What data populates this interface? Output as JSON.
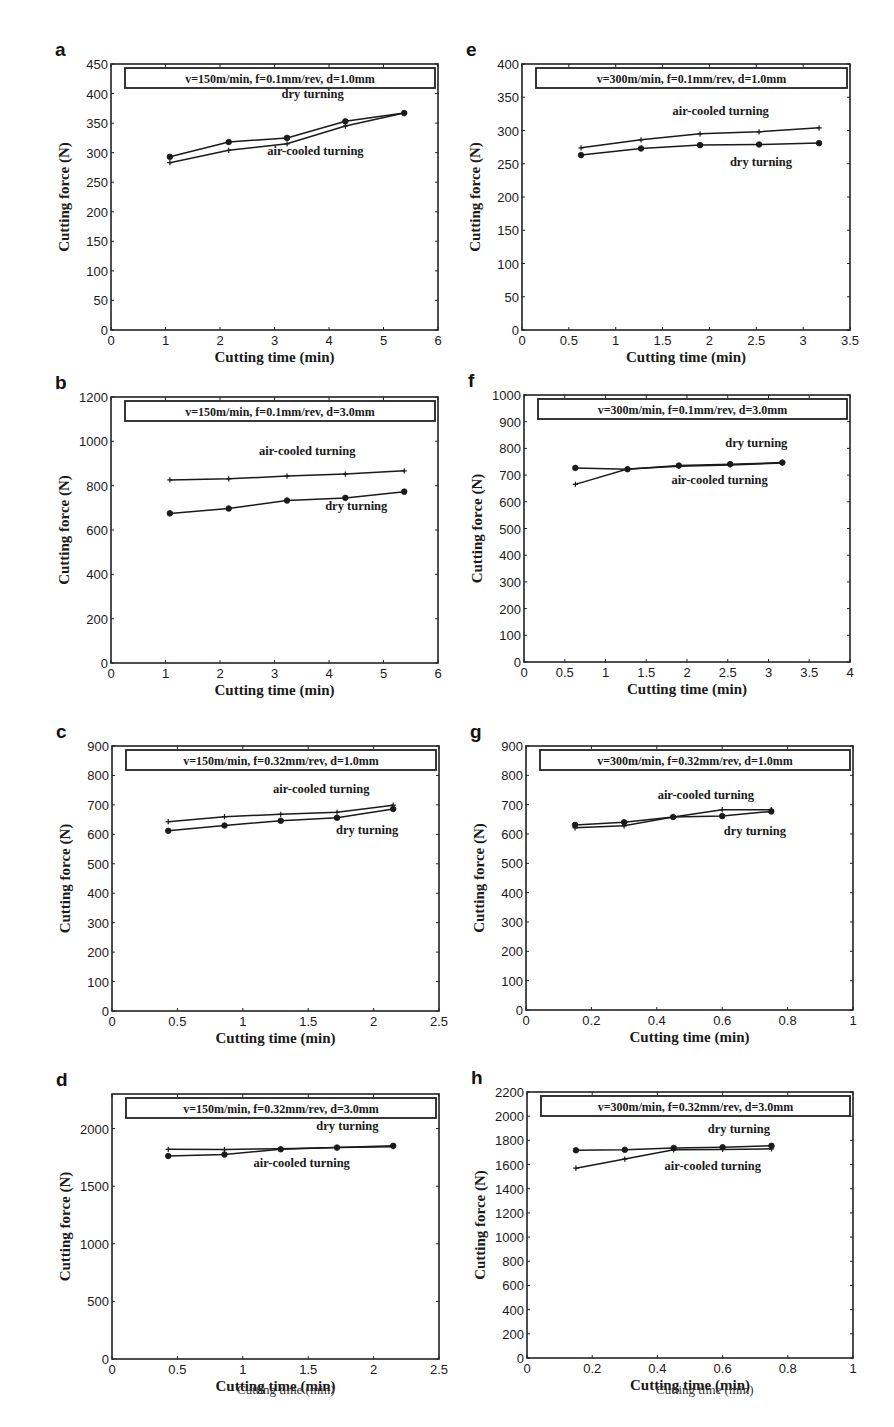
{
  "figure": {
    "y_axis_label": "Cutting force (N)",
    "x_axis_label": "Cutting time (min)",
    "footer_labels": [
      "Cutting time (min)",
      "Cutting time (min)"
    ]
  },
  "chart_data": [
    {
      "panel": "a",
      "type": "line",
      "condition": "v=150m/min, f=0.1mm/rev, d=1.0mm",
      "xlabel": "Cutting time (min)",
      "ylabel": "Cutting force (N)",
      "xlim": [
        0,
        6
      ],
      "ylim": [
        0,
        450
      ],
      "xticks": [
        0,
        1,
        2,
        3,
        4,
        5,
        6
      ],
      "yticks": [
        0,
        50,
        100,
        150,
        200,
        250,
        300,
        350,
        400,
        450
      ],
      "x": [
        1.08,
        2.16,
        3.23,
        4.3,
        5.38
      ],
      "series": [
        {
          "name": "dry turning",
          "marker": "circle",
          "values": [
            293,
            318,
            325,
            353,
            367
          ]
        },
        {
          "name": "air-cooled turning",
          "marker": "plus",
          "values": [
            283,
            304,
            315,
            345,
            367
          ]
        }
      ],
      "annotations": [
        {
          "text": "dry turning",
          "x": 3.7,
          "y": 392
        },
        {
          "text": "air-cooled turning",
          "x": 3.75,
          "y": 296
        }
      ]
    },
    {
      "panel": "b",
      "type": "line",
      "condition": "v=150m/min, f=0.1mm/rev, d=3.0mm",
      "xlabel": "Cutting time (min)",
      "ylabel": "Cutting force (N)",
      "xlim": [
        0,
        6
      ],
      "ylim": [
        0,
        1200
      ],
      "xticks": [
        0,
        1,
        2,
        3,
        4,
        5,
        6
      ],
      "yticks": [
        0,
        200,
        400,
        600,
        800,
        1000,
        1200
      ],
      "x": [
        1.08,
        2.16,
        3.23,
        4.3,
        5.38
      ],
      "series": [
        {
          "name": "air-cooled turning",
          "marker": "plus",
          "values": [
            826,
            831,
            843,
            852,
            867
          ]
        },
        {
          "name": "dry turning",
          "marker": "circle",
          "values": [
            675,
            697,
            733,
            745,
            773
          ]
        }
      ],
      "annotations": [
        {
          "text": "air-cooled turning",
          "x": 3.6,
          "y": 940
        },
        {
          "text": "dry turning",
          "x": 4.5,
          "y": 690
        }
      ]
    },
    {
      "panel": "c",
      "type": "line",
      "condition": "v=150m/min, f=0.32mm/rev, d=1.0mm",
      "xlabel": "Cutting time (min)",
      "ylabel": "Cutting force (N)",
      "xlim": [
        0,
        2.5
      ],
      "ylim": [
        0,
        900
      ],
      "xticks": [
        0,
        0.5,
        1,
        1.5,
        2,
        2.5
      ],
      "yticks": [
        0,
        100,
        200,
        300,
        400,
        500,
        600,
        700,
        800,
        900
      ],
      "x": [
        0.43,
        0.86,
        1.29,
        1.72,
        2.15
      ],
      "series": [
        {
          "name": "air-cooled turning",
          "marker": "plus",
          "values": [
            643,
            660,
            668,
            675,
            699
          ]
        },
        {
          "name": "dry turning",
          "marker": "circle",
          "values": [
            612,
            630,
            646,
            656,
            686
          ]
        }
      ],
      "annotations": [
        {
          "text": "air-cooled turning",
          "x": 1.6,
          "y": 740
        },
        {
          "text": "dry turning",
          "x": 1.95,
          "y": 600
        }
      ]
    },
    {
      "panel": "d",
      "type": "line",
      "condition": "v=150m/min, f=0.32mm/rev, d=3.0mm",
      "xlabel": "Cutting time (min)",
      "ylabel": "Cutting force (N)",
      "xlim": [
        0,
        2.5
      ],
      "ylim": [
        0,
        2300
      ],
      "xticks": [
        0,
        0.5,
        1,
        1.5,
        2,
        2.5
      ],
      "yticks": [
        0,
        500,
        1000,
        1500,
        2000
      ],
      "x": [
        0.43,
        0.86,
        1.29,
        1.72,
        2.15
      ],
      "series": [
        {
          "name": "dry turning",
          "marker": "plus",
          "values": [
            1820,
            1818,
            1825,
            1835,
            1842
          ]
        },
        {
          "name": "air-cooled turning",
          "marker": "circle",
          "values": [
            1762,
            1775,
            1820,
            1835,
            1850
          ]
        }
      ],
      "annotations": [
        {
          "text": "dry turning",
          "x": 1.8,
          "y": 1985
        },
        {
          "text": "air-cooled turning",
          "x": 1.45,
          "y": 1670
        }
      ]
    },
    {
      "panel": "e",
      "type": "line",
      "condition": "v=300m/min, f=0.1mm/rev, d=1.0mm",
      "xlabel": "Cutting time (min)",
      "ylabel": "Cutting force (N)",
      "xlim": [
        0,
        3.5
      ],
      "ylim": [
        0,
        400
      ],
      "xticks": [
        0,
        0.5,
        1,
        1.5,
        2,
        2.5,
        3,
        3.5
      ],
      "yticks": [
        0,
        50,
        100,
        150,
        200,
        250,
        300,
        350,
        400
      ],
      "x": [
        0.63,
        1.27,
        1.9,
        2.53,
        3.17
      ],
      "series": [
        {
          "name": "air-cooled turning",
          "marker": "plus",
          "values": [
            274,
            286,
            295,
            298,
            304
          ]
        },
        {
          "name": "dry turning",
          "marker": "circle",
          "values": [
            263,
            273,
            278,
            279,
            281
          ]
        }
      ],
      "annotations": [
        {
          "text": "air-cooled turning",
          "x": 2.12,
          "y": 323
        },
        {
          "text": "dry turning",
          "x": 2.55,
          "y": 247
        }
      ]
    },
    {
      "panel": "f",
      "type": "line",
      "condition": "v=300m/min, f=0.1mm/rev, d=3.0mm",
      "xlabel": "Cutting time (min)",
      "ylabel": "Cutting force (N)",
      "xlim": [
        0,
        4
      ],
      "ylim": [
        0,
        1000
      ],
      "xticks": [
        0,
        0.5,
        1,
        1.5,
        2,
        2.5,
        3,
        3.5,
        4
      ],
      "yticks": [
        0,
        100,
        200,
        300,
        400,
        500,
        600,
        700,
        800,
        900,
        1000
      ],
      "x": [
        0.63,
        1.27,
        1.9,
        2.53,
        3.17
      ],
      "series": [
        {
          "name": "dry turning",
          "marker": "circle",
          "values": [
            727,
            722,
            736,
            741,
            747
          ]
        },
        {
          "name": "air-cooled turning",
          "marker": "plus",
          "values": [
            665,
            723,
            733,
            738,
            745
          ]
        }
      ],
      "annotations": [
        {
          "text": "dry turning",
          "x": 2.85,
          "y": 805
        },
        {
          "text": "air-cooled turning",
          "x": 2.4,
          "y": 665
        }
      ]
    },
    {
      "panel": "g",
      "type": "line",
      "condition": "v=300m/min, f=0.32mm/rev, d=1.0mm",
      "xlabel": "Cutting time (min)",
      "ylabel": "Cutting force (N)",
      "xlim": [
        0,
        1
      ],
      "ylim": [
        0,
        900
      ],
      "xticks": [
        0,
        0.2,
        0.4,
        0.6,
        0.8,
        1
      ],
      "yticks": [
        0,
        100,
        200,
        300,
        400,
        500,
        600,
        700,
        800,
        900
      ],
      "x": [
        0.15,
        0.3,
        0.45,
        0.6,
        0.75
      ],
      "series": [
        {
          "name": "air-cooled turning",
          "marker": "plus",
          "values": [
            621,
            628,
            658,
            683,
            683
          ]
        },
        {
          "name": "dry turning",
          "marker": "circle",
          "values": [
            631,
            640,
            658,
            661,
            677
          ]
        }
      ],
      "annotations": [
        {
          "text": "air-cooled turning",
          "x": 0.55,
          "y": 720
        },
        {
          "text": "dry turning",
          "x": 0.7,
          "y": 595
        }
      ]
    },
    {
      "panel": "h",
      "type": "line",
      "condition": "v=300m/min, f=0.32mm/rev, d=3.0mm",
      "xlabel": "Cutting time (min)",
      "ylabel": "Cutting force (N)",
      "xlim": [
        0,
        1
      ],
      "ylim": [
        0,
        2200
      ],
      "xticks": [
        0,
        0.2,
        0.4,
        0.6,
        0.8,
        1
      ],
      "yticks": [
        0,
        200,
        400,
        600,
        800,
        1000,
        1200,
        1400,
        1600,
        1800,
        2000,
        2200
      ],
      "x": [
        0.15,
        0.3,
        0.45,
        0.6,
        0.75
      ],
      "series": [
        {
          "name": "dry turning",
          "marker": "circle",
          "values": [
            1718,
            1722,
            1737,
            1743,
            1755
          ]
        },
        {
          "name": "air-cooled turning",
          "marker": "plus",
          "values": [
            1570,
            1645,
            1722,
            1725,
            1730
          ]
        }
      ],
      "annotations": [
        {
          "text": "dry turning",
          "x": 0.65,
          "y": 1860
        },
        {
          "text": "air-cooled turning",
          "x": 0.57,
          "y": 1555
        }
      ]
    }
  ],
  "layout": {
    "panels": [
      {
        "x0": 111,
        "y0": 64,
        "x1": 438,
        "y1": 330
      },
      {
        "x0": 111,
        "y0": 397,
        "x1": 438,
        "y1": 663
      },
      {
        "x0": 112,
        "y0": 746,
        "x1": 439,
        "y1": 1011
      },
      {
        "x0": 112,
        "y0": 1094,
        "x1": 439,
        "y1": 1359
      },
      {
        "x0": 522,
        "y0": 64,
        "x1": 850,
        "y1": 330
      },
      {
        "x0": 524,
        "y0": 395,
        "x1": 850,
        "y1": 662
      },
      {
        "x0": 526,
        "y0": 746,
        "x1": 853,
        "y1": 1010
      },
      {
        "x0": 527,
        "y0": 1092,
        "x1": 853,
        "y1": 1358
      }
    ]
  }
}
